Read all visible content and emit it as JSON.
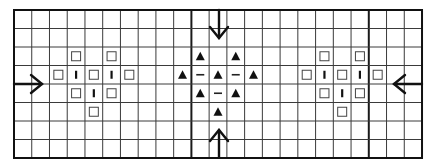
{
  "diagram": {
    "grid": {
      "origin_x": 14,
      "origin_y": 10,
      "cols": 23,
      "rows": 8,
      "cell_w": 17.74,
      "cell_h": 18.5,
      "thick_col_lines": [
        10,
        20
      ],
      "line_color": "#3a3a3a",
      "thick_line_color": "#1a1a1a"
    },
    "motifs": [
      {
        "name": "left-motif",
        "cells": [
          {
            "row": 2,
            "col": 3,
            "symbol": "square"
          },
          {
            "row": 2,
            "col": 5,
            "symbol": "square"
          },
          {
            "row": 3,
            "col": 2,
            "symbol": "square"
          },
          {
            "row": 3,
            "col": 3,
            "symbol": "bar"
          },
          {
            "row": 3,
            "col": 4,
            "symbol": "square"
          },
          {
            "row": 3,
            "col": 5,
            "symbol": "bar"
          },
          {
            "row": 3,
            "col": 6,
            "symbol": "square"
          },
          {
            "row": 4,
            "col": 3,
            "symbol": "square"
          },
          {
            "row": 4,
            "col": 4,
            "symbol": "bar"
          },
          {
            "row": 4,
            "col": 5,
            "symbol": "square"
          },
          {
            "row": 5,
            "col": 4,
            "symbol": "square"
          }
        ]
      },
      {
        "name": "center-motif",
        "cells": [
          {
            "row": 2,
            "col": 10,
            "symbol": "triangle"
          },
          {
            "row": 2,
            "col": 12,
            "symbol": "triangle"
          },
          {
            "row": 3,
            "col": 9,
            "symbol": "triangle"
          },
          {
            "row": 3,
            "col": 10,
            "symbol": "dash"
          },
          {
            "row": 3,
            "col": 11,
            "symbol": "triangle"
          },
          {
            "row": 3,
            "col": 12,
            "symbol": "dash"
          },
          {
            "row": 3,
            "col": 13,
            "symbol": "triangle"
          },
          {
            "row": 4,
            "col": 10,
            "symbol": "triangle"
          },
          {
            "row": 4,
            "col": 11,
            "symbol": "dash"
          },
          {
            "row": 4,
            "col": 12,
            "symbol": "triangle"
          },
          {
            "row": 5,
            "col": 11,
            "symbol": "triangle"
          }
        ]
      },
      {
        "name": "right-motif",
        "cells": [
          {
            "row": 2,
            "col": 17,
            "symbol": "square"
          },
          {
            "row": 2,
            "col": 19,
            "symbol": "square"
          },
          {
            "row": 3,
            "col": 16,
            "symbol": "square"
          },
          {
            "row": 3,
            "col": 17,
            "symbol": "bar"
          },
          {
            "row": 3,
            "col": 18,
            "symbol": "square"
          },
          {
            "row": 3,
            "col": 19,
            "symbol": "bar"
          },
          {
            "row": 3,
            "col": 20,
            "symbol": "square"
          },
          {
            "row": 4,
            "col": 17,
            "symbol": "square"
          },
          {
            "row": 4,
            "col": 18,
            "symbol": "bar"
          },
          {
            "row": 4,
            "col": 19,
            "symbol": "square"
          },
          {
            "row": 5,
            "col": 18,
            "symbol": "square"
          }
        ]
      }
    ],
    "arrows": [
      {
        "name": "arrow-right-from-left-edge",
        "direction": "right",
        "from": [
          14,
          84
        ],
        "to": [
          42,
          84
        ]
      },
      {
        "name": "arrow-left-from-right-edge",
        "direction": "left",
        "from": [
          422,
          84
        ],
        "to": [
          394,
          84
        ]
      },
      {
        "name": "arrow-down-from-top-edge",
        "direction": "down",
        "from": [
          219,
          10
        ],
        "to": [
          219,
          38
        ]
      },
      {
        "name": "arrow-up-from-bottom-edge",
        "direction": "up",
        "from": [
          219,
          158
        ],
        "to": [
          219,
          130
        ]
      }
    ]
  }
}
